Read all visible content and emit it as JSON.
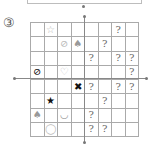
{
  "puzzle": {
    "label": "③",
    "columns": 8,
    "rows": 8,
    "icons": {
      "star-outline": "☆",
      "no-sign-light": "⊘",
      "tulip-gray": "♠",
      "question": "?",
      "no-sign-black": "⊘",
      "heart-outline": "♡",
      "x-black": "✖",
      "star-black": "★",
      "smile-gray": "◡",
      "circle-outline": "◯"
    },
    "grid": [
      [
        "",
        "star-outline",
        "",
        "",
        "",
        "",
        "question",
        ""
      ],
      [
        "",
        "",
        "no-sign-light",
        "tulip-gray",
        "",
        "question",
        "",
        ""
      ],
      [
        "",
        "",
        "",
        "",
        "question",
        "",
        "question",
        "question"
      ],
      [
        "no-sign-black",
        "",
        "heart-outline",
        "",
        "",
        "",
        "",
        "question"
      ],
      [
        "",
        "",
        "",
        "x-black",
        "question",
        "",
        "question",
        "question"
      ],
      [
        "",
        "star-black",
        "",
        "",
        "",
        "question",
        "",
        ""
      ],
      [
        "tulip-gray",
        "",
        "smile-gray",
        "",
        "question",
        "",
        "",
        ""
      ],
      [
        "",
        "circle-outline",
        "",
        "",
        "question",
        "question",
        "",
        ""
      ]
    ],
    "colors": {
      "grid_line": "#aaaaaa",
      "question": "#666666",
      "black_symbol": "#111111",
      "gray_symbol": "#999999",
      "light_symbol": "#bbbbbb"
    }
  }
}
